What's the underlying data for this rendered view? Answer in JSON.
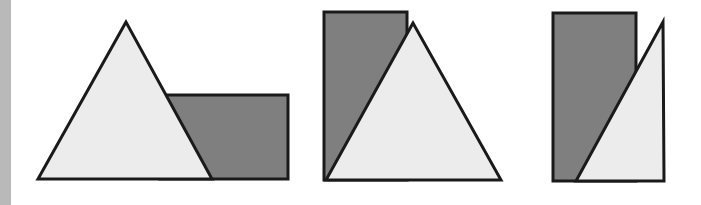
{
  "colors": {
    "background": "#ffffff",
    "left_bar": "#b9b9b9",
    "rect_fill": "#7f7f7f",
    "triangle_fill": "#ececec",
    "stroke": "#1a1a1a"
  },
  "figures": [
    {
      "id": "figure-1",
      "rectangle": {
        "points": "160,95 288,95 288,179 160,179"
      },
      "triangle": {
        "points": "126,22 38,179 212,179"
      }
    },
    {
      "id": "figure-2",
      "rectangle": {
        "points": "324,12 407,12 407,180 324,180"
      },
      "triangle": {
        "points": "413,23 326,180 501,180"
      }
    },
    {
      "id": "figure-3",
      "rectangle": {
        "points": "553,13 636,13 636,181 553,181"
      },
      "triangle": {
        "points": "663,22 576,181 664,181"
      }
    }
  ]
}
